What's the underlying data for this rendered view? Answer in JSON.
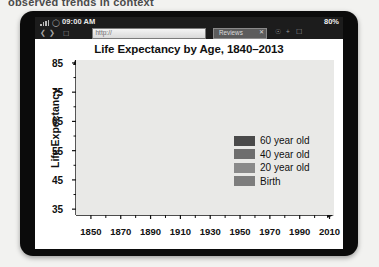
{
  "caption": "observed trends in context",
  "device": {
    "status_bar": {
      "signal_icon": "signal-bars-icon",
      "wifi_icon": "wifi-icon",
      "time": "09:00 AM",
      "battery": "80%"
    },
    "browser": {
      "back_icon": "back-arrow-icon",
      "forward_icon": "forward-arrow-icon",
      "bookmark_icon": "bookmark-icon",
      "url_value": "http://",
      "url_placeholder": "http://",
      "tab_label": "Reviews",
      "tab_close_icon": "close-icon",
      "toolbar_icons": [
        "lock-icon",
        "add-icon",
        "tabs-icon"
      ]
    }
  },
  "chart_data": {
    "type": "line",
    "title": "Life Expectancy by Age, 1840–2013",
    "xlabel": "",
    "ylabel": "Life Expectancy",
    "xlim": [
      1840,
      2013
    ],
    "ylim": [
      33,
      86
    ],
    "yticks": [
      35,
      45,
      55,
      65,
      75,
      85
    ],
    "xticks": [
      1850,
      1870,
      1890,
      1910,
      1930,
      1950,
      1970,
      1990,
      2010
    ],
    "xminorstep": 10,
    "grid": false,
    "legend_position": "center-right",
    "background": "#e9e9e7",
    "series": [
      {
        "name": "60 year old",
        "color": "#4a4a4a",
        "x": [
          1840,
          1845,
          1850,
          1855,
          1860,
          1865,
          1870,
          1875,
          1880,
          1885,
          1890,
          1895,
          1900,
          1905,
          1910,
          1913,
          1916,
          1918,
          1920,
          1925,
          1930,
          1935,
          1940,
          1945,
          1950,
          1955,
          1960,
          1965,
          1970,
          1975,
          1980,
          1985,
          1990,
          1995,
          2000,
          2005,
          2010,
          2013
        ],
        "values": [
          74.2,
          74.0,
          74.3,
          74.1,
          74.4,
          74.2,
          74.5,
          74.3,
          74.6,
          74.4,
          74.7,
          74.6,
          74.9,
          74.8,
          75.0,
          75.1,
          74.9,
          74.2,
          75.2,
          75.4,
          75.6,
          75.8,
          76.0,
          76.3,
          76.6,
          76.9,
          77.2,
          77.5,
          78.0,
          78.6,
          79.2,
          79.8,
          80.4,
          80.9,
          81.6,
          82.2,
          83.0,
          83.4
        ]
      },
      {
        "name": "40 year old",
        "color": "#6e6e6e",
        "x": [
          1840,
          1845,
          1850,
          1855,
          1860,
          1865,
          1870,
          1875,
          1880,
          1885,
          1890,
          1895,
          1900,
          1905,
          1910,
          1913,
          1916,
          1918,
          1920,
          1925,
          1930,
          1935,
          1940,
          1945,
          1950,
          1955,
          1960,
          1965,
          1970,
          1975,
          1980,
          1985,
          1990,
          1995,
          2000,
          2005,
          2010,
          2013
        ],
        "values": [
          67.2,
          66.9,
          67.3,
          67.0,
          67.4,
          67.1,
          67.5,
          67.3,
          67.7,
          67.5,
          67.9,
          67.8,
          68.1,
          68.0,
          68.4,
          68.6,
          68.2,
          66.2,
          68.8,
          69.3,
          69.8,
          70.2,
          70.7,
          71.3,
          71.9,
          72.3,
          72.8,
          73.2,
          73.9,
          74.7,
          75.5,
          76.3,
          77.1,
          77.8,
          78.6,
          79.5,
          80.4,
          81.0
        ]
      },
      {
        "name": "20 year old",
        "color": "#8a8a8a",
        "x": [
          1840,
          1845,
          1850,
          1855,
          1860,
          1865,
          1870,
          1875,
          1880,
          1885,
          1890,
          1895,
          1900,
          1905,
          1910,
          1913,
          1916,
          1918,
          1920,
          1925,
          1930,
          1935,
          1940,
          1945,
          1950,
          1955,
          1960,
          1965,
          1970,
          1975,
          1980,
          1985,
          1990,
          1995,
          2000,
          2005,
          2010,
          2013
        ],
        "values": [
          60.2,
          59.6,
          60.4,
          59.9,
          60.6,
          60.1,
          60.9,
          60.5,
          61.3,
          61.0,
          61.7,
          61.6,
          62.1,
          62.0,
          62.8,
          63.2,
          62.4,
          56.4,
          63.8,
          64.6,
          65.4,
          66.0,
          66.8,
          67.6,
          68.4,
          69.0,
          69.6,
          70.0,
          70.8,
          71.8,
          72.8,
          73.8,
          74.8,
          75.6,
          76.6,
          77.6,
          78.6,
          79.3
        ]
      },
      {
        "name": "Birth",
        "color": "#7d7d7d",
        "x": [
          1840,
          1845,
          1850,
          1855,
          1860,
          1865,
          1870,
          1875,
          1880,
          1885,
          1890,
          1895,
          1900,
          1905,
          1910,
          1913,
          1916,
          1918,
          1920,
          1925,
          1930,
          1935,
          1940,
          1945,
          1950,
          1955,
          1960,
          1965,
          1970,
          1975,
          1980,
          1985,
          1990,
          1995,
          2000,
          2005,
          2010,
          2013
        ],
        "values": [
          41.0,
          40.4,
          41.2,
          39.6,
          41.8,
          40.2,
          42.4,
          41.4,
          43.0,
          42.4,
          43.6,
          44.2,
          45.6,
          46.8,
          49.2,
          51.4,
          51.0,
          39.2,
          54.0,
          56.6,
          58.6,
          60.2,
          62.4,
          64.4,
          66.2,
          67.2,
          68.2,
          68.8,
          69.8,
          71.2,
          72.8,
          73.8,
          74.6,
          75.2,
          76.2,
          77.0,
          78.2,
          78.8
        ]
      }
    ],
    "legend": [
      {
        "label": "60 year old",
        "color": "#4a4a4a"
      },
      {
        "label": "40 year old",
        "color": "#6e6e6e"
      },
      {
        "label": "20 year old",
        "color": "#8a8a8a"
      },
      {
        "label": "Birth",
        "color": "#7d7d7d"
      }
    ]
  }
}
